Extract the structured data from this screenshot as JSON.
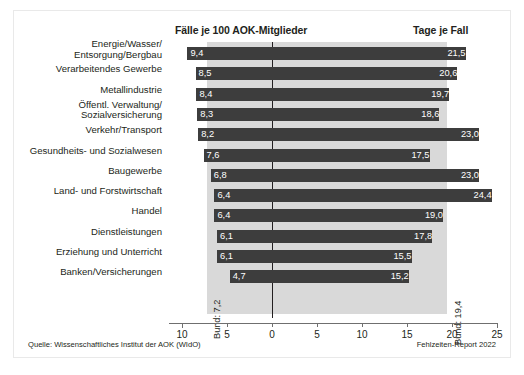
{
  "figure": {
    "header_left": "Fälle je 100 AOK-Mitglieder",
    "header_right": "Tage je Fall",
    "source": "Quelle: Wissenschaftliches Institut der AOK (WIdO)",
    "report": "Fehlzeiten-Report 2022",
    "bund_left_label": "Bund: 7,2",
    "bund_right_label": "Bund: 19,4"
  },
  "chart_data": {
    "type": "bar",
    "orientation": "horizontal-diverging",
    "title": "",
    "xlabel": "",
    "ylabel": "",
    "grid": false,
    "legend": "none",
    "axis_ticks": [
      {
        "label": "10",
        "value": -10
      },
      {
        "label": "5",
        "value": -5
      },
      {
        "label": "0",
        "value": 0
      },
      {
        "label": "5",
        "value": 5
      },
      {
        "label": "10",
        "value": 10
      },
      {
        "label": "15",
        "value": 15
      },
      {
        "label": "20",
        "value": 20
      },
      {
        "label": "25",
        "value": 25
      }
    ],
    "xlim": [
      -10,
      25
    ],
    "reference_lines": [
      {
        "name": "Bund Fälle je 100 AOK-Mitglieder",
        "value": 7.2,
        "label": "Bund: 7,2",
        "side": "left"
      },
      {
        "name": "Bund Tage je Fall",
        "value": 19.4,
        "label": "Bund: 19,4",
        "side": "right"
      }
    ],
    "categories": [
      "Energie/Wasser/\nEntsorgung/Bergbau",
      "Verarbeitendes Gewerbe",
      "Metallindustrie",
      "Öffentl. Verwaltung/\nSozialversicherung",
      "Verkehr/Transport",
      "Gesundheits- und Sozialwesen",
      "Baugewerbe",
      "Land- und Forstwirtschaft",
      "Handel",
      "Dienstleistungen",
      "Erziehung und Unterricht",
      "Banken/Versicherungen"
    ],
    "series": [
      {
        "name": "Fälle je 100 AOK-Mitglieder",
        "side": "left",
        "values": [
          9.4,
          8.5,
          8.4,
          8.3,
          8.2,
          7.6,
          6.8,
          6.4,
          6.4,
          6.1,
          6.1,
          4.7
        ],
        "labels": [
          "9,4",
          "8,5",
          "8,4",
          "8,3",
          "8,2",
          "7,6",
          "6,8",
          "6,4",
          "6,4",
          "6,1",
          "6,1",
          "4,7"
        ]
      },
      {
        "name": "Tage je Fall",
        "side": "right",
        "values": [
          21.5,
          20.6,
          19.7,
          18.6,
          23.0,
          17.5,
          23.0,
          24.4,
          19.0,
          17.8,
          15.5,
          15.2
        ],
        "labels": [
          "21,5",
          "20,6",
          "19,7",
          "18,6",
          "23,0",
          "17,5",
          "23,0",
          "24,4",
          "19,0",
          "17,8",
          "15,5",
          "15,2"
        ]
      }
    ],
    "colors": {
      "bar": "#3d3d3d",
      "band": "#d9d9d9",
      "axis": "#6f6f6f",
      "text": "#231f20",
      "value_text": "#ffffff",
      "background": "#ffffff"
    }
  }
}
